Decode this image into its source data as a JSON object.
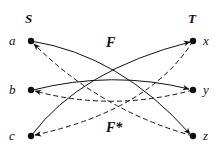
{
  "diagram": {
    "sets": {
      "S": {
        "label": "S",
        "x": 29,
        "y": 23
      },
      "T": {
        "label": "T",
        "x": 192,
        "y": 23
      }
    },
    "points": {
      "a": {
        "label": "a",
        "x": 31,
        "y": 41
      },
      "b": {
        "label": "b",
        "x": 31,
        "y": 90
      },
      "c": {
        "label": "c",
        "x": 31,
        "y": 136
      },
      "x": {
        "label": "x",
        "x": 193,
        "y": 41
      },
      "y": {
        "label": "y",
        "x": 193,
        "y": 90
      },
      "z": {
        "label": "z",
        "x": 193,
        "y": 136
      }
    },
    "maps": {
      "F": {
        "label": "F",
        "style": "solid",
        "edges": [
          [
            "a",
            "z"
          ],
          [
            "b",
            "y"
          ],
          [
            "c",
            "x"
          ]
        ]
      },
      "F_star": {
        "label": "F*",
        "style": "dashed",
        "edges": [
          [
            "x",
            "c"
          ],
          [
            "y",
            "b"
          ],
          [
            "z",
            "a"
          ]
        ]
      }
    },
    "colors": {
      "ink": "#111111",
      "background": "#ffffff"
    }
  }
}
